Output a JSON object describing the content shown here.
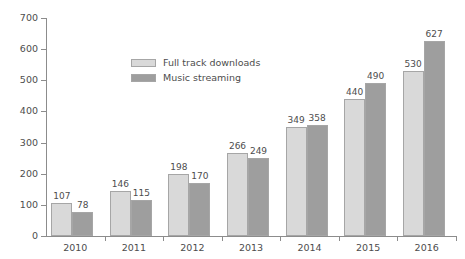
{
  "chart_data": {
    "type": "bar",
    "title": "",
    "subtitle": "",
    "xlabel": "",
    "ylabel": "",
    "categories": [
      "2010",
      "2011",
      "2012",
      "2013",
      "2014",
      "2015",
      "2016"
    ],
    "series": [
      {
        "name": "Full track downloads",
        "color": "#d9d9d9",
        "values": [
          107,
          146,
          198,
          266,
          349,
          440,
          530
        ]
      },
      {
        "name": "Music streaming",
        "color": "#9e9e9e",
        "values": [
          78,
          115,
          170,
          249,
          358,
          490,
          627
        ]
      }
    ],
    "ylim": [
      0,
      700
    ],
    "ytick_values": [
      0,
      100,
      200,
      300,
      400,
      500,
      600,
      700
    ],
    "ytick_labels": [
      "0",
      "100",
      "200",
      "300",
      "400",
      "500",
      "600",
      "700"
    ],
    "grid": false,
    "legend_position": "upper-left-inside",
    "data_labels": true,
    "axis_color": "#8c8c8c",
    "text_color": "#4d4d4d",
    "background": "#ffffff"
  }
}
